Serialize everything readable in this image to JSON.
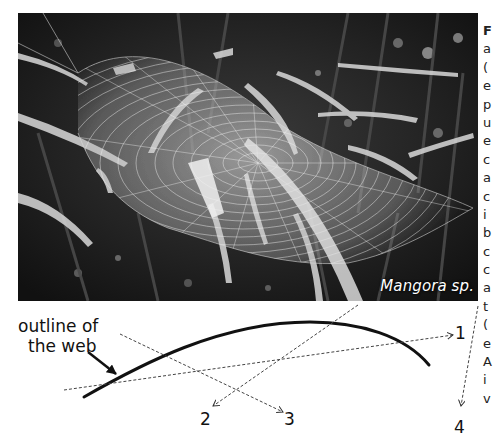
{
  "figure": {
    "photo": {
      "species_label": "Mangora sp.",
      "description": "black-and-white photo of an orb web among grass blades"
    },
    "diagram": {
      "outline_label_line1": "outline of",
      "outline_label_line2": "the web",
      "directions": [
        {
          "id": "1",
          "label": "1"
        },
        {
          "id": "2",
          "label": "2"
        },
        {
          "id": "3",
          "label": "3"
        },
        {
          "id": "4",
          "label": "4"
        }
      ]
    },
    "caption_column_fragment": [
      "F",
      "a",
      "(",
      "e",
      "p",
      "u",
      "e",
      "c",
      "a",
      "c",
      "i",
      "b",
      "c",
      "c",
      "a",
      "t",
      "(",
      "e",
      "A",
      "i",
      "v"
    ]
  }
}
